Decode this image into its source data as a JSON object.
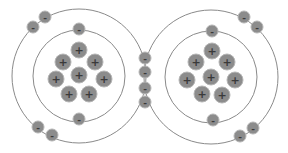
{
  "diagram": {
    "colors": {
      "particle": "#8c8c8c",
      "orbit": "#8a8a8a",
      "sign": "#3a3a3a",
      "background": "#ffffff"
    },
    "atoms": [
      {
        "name": "left-atom",
        "center": [
          79,
          76
        ],
        "orbits": [
          46,
          67
        ],
        "protons": [
          [
            79,
            50
          ],
          [
            63,
            62
          ],
          [
            95,
            62
          ],
          [
            56,
            79
          ],
          [
            79,
            75
          ],
          [
            104,
            79
          ],
          [
            69,
            94
          ],
          [
            89,
            94
          ]
        ],
        "inner_electrons": [
          [
            79,
            29
          ],
          [
            79,
            119
          ]
        ],
        "outer_electrons": [
          [
            33,
            27
          ],
          [
            45,
            17
          ],
          [
            38,
            127
          ],
          [
            52,
            135
          ]
        ]
      },
      {
        "name": "right-atom",
        "center": [
          211,
          77
        ],
        "orbits": [
          46,
          67
        ],
        "protons": [
          [
            212,
            51
          ],
          [
            196,
            62
          ],
          [
            227,
            62
          ],
          [
            187,
            80
          ],
          [
            211,
            77
          ],
          [
            235,
            80
          ],
          [
            202,
            94
          ],
          [
            222,
            95
          ]
        ],
        "inner_electrons": [
          [
            212,
            31
          ],
          [
            213,
            120
          ]
        ],
        "outer_electrons": [
          [
            244,
            17
          ],
          [
            257,
            27
          ],
          [
            253,
            128
          ],
          [
            240,
            136
          ]
        ]
      }
    ],
    "shared_electrons": [
      [
        145,
        58
      ],
      [
        145,
        72
      ],
      [
        145,
        88
      ],
      [
        145,
        102
      ]
    ],
    "proton_symbol": "+",
    "electron_symbol": "-",
    "proton_radius": 8,
    "electron_radius": 6
  }
}
